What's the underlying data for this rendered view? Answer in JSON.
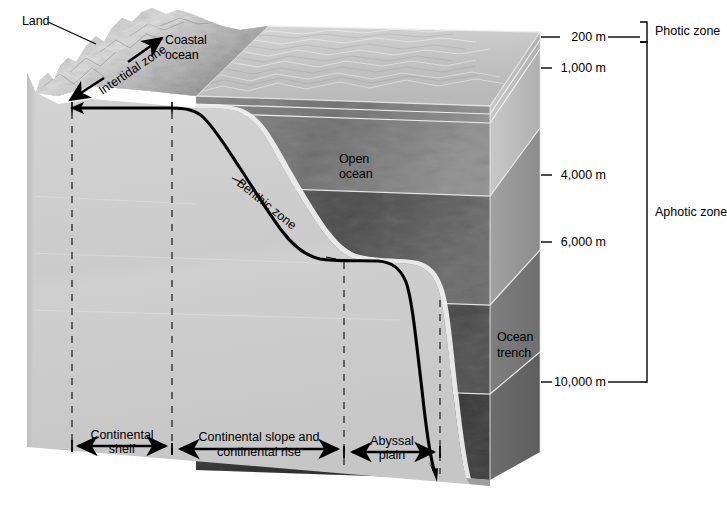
{
  "figure": {
    "type": "diagram"
  },
  "labels": {
    "land": "Land",
    "intertidal_zone": "Intertidal zone",
    "coastal_ocean_line1": "Coastal",
    "coastal_ocean_line2": "ocean",
    "open_ocean_line1": "Open",
    "open_ocean_line2": "ocean",
    "benthic_zone": "Benthic zone",
    "ocean_trench_line1": "Ocean",
    "ocean_trench_line2": "trench"
  },
  "depth_scale": {
    "unit": "m",
    "ticks": [
      {
        "label": "200 m",
        "depth": 200,
        "y": 37
      },
      {
        "label": "1,000 m",
        "depth": 1000,
        "y": 68
      },
      {
        "label": "4,000 m",
        "depth": 4000,
        "y": 175
      },
      {
        "label": "6,000 m",
        "depth": 6000,
        "y": 242
      },
      {
        "label": "10,000 m",
        "depth": 10000,
        "y": 382
      }
    ]
  },
  "light_zones": [
    {
      "name": "Photic zone",
      "from_m": 0,
      "to_m": 200,
      "y_top": 22,
      "y_bottom": 42
    },
    {
      "name": "Aphotic zone",
      "from_m": 200,
      "to_m": 10000,
      "y_top": 42,
      "y_bottom": 382
    }
  ],
  "seafloor_regions": [
    {
      "name_line1": "Continental",
      "name_line2": "shelf",
      "x_start": 72,
      "x_end": 172
    },
    {
      "name_line1": "Continental slope and",
      "name_line2": "continental rise",
      "x_start": 172,
      "x_end": 344
    },
    {
      "name_line1": "Abyssal",
      "name_line2": "plain",
      "x_start": 344,
      "x_end": 440
    }
  ],
  "colors": {
    "land_light": "#dcdcdc",
    "land_shadow": "#a8a8a8",
    "block_front": "#cfcfcf",
    "block_side": "#b4b4b4",
    "water_surface": "#c9c9c9",
    "water_mid": "#9a9a9a",
    "water_deep": "#7c7c7c",
    "water_trench": "#6a6a6a",
    "sediment": "#e2e2e2",
    "line": "#000000",
    "dashed": "#555555",
    "edge_light": "#f2f2f2"
  }
}
